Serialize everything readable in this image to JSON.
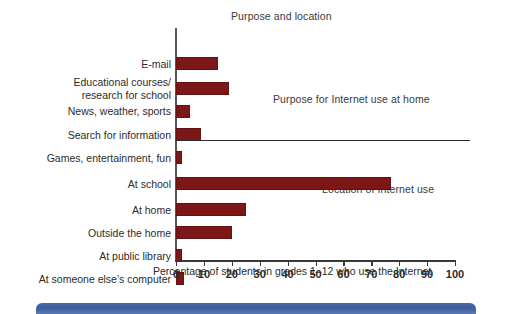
{
  "figure": {
    "title": "Purpose and location",
    "axis_title": "Percentage of students in grades 1–12 who use the Internet",
    "panel_captions": {
      "purpose": "Purpose for Internet use at home",
      "location": "Location of Internet use"
    },
    "bar_color": "#7d1616",
    "axis_color": "#3a3a3a",
    "footer_accent_color": "#3d5c9b"
  },
  "chart_data": {
    "type": "bar",
    "orientation": "horizontal",
    "title": "Purpose and location",
    "xlabel": "Percentage of students in grades 1–12 who use the Internet",
    "ylabel": "",
    "xlim": [
      0,
      100
    ],
    "grid": false,
    "legend": null,
    "xticks": [
      0,
      10,
      20,
      30,
      40,
      50,
      60,
      70,
      80,
      90,
      100
    ],
    "xticklabels": [
      "0",
      "10",
      "20",
      "30",
      "40",
      "50",
      "60",
      "70",
      "80",
      "90",
      "100"
    ],
    "groups": [
      {
        "caption": "Purpose for Internet use at home",
        "categories": [
          "E-mail",
          "Educational courses/\nresearch for school",
          "News, weather, sports",
          "Search for information",
          "Games, entertainment, fun"
        ],
        "values": [
          15,
          19,
          5,
          9,
          2
        ]
      },
      {
        "caption": "Location of Internet use",
        "categories": [
          "At school",
          "At home",
          "Outside the home",
          "At public library",
          "At someone else's computer"
        ],
        "values": [
          77,
          25,
          20,
          2,
          3
        ]
      }
    ],
    "categories": [
      "E-mail",
      "Educational courses/research for school",
      "News, weather, sports",
      "Search for information",
      "Games, entertainment, fun",
      "At school",
      "At home",
      "Outside the home",
      "At public library",
      "At someone else's computer"
    ],
    "values": [
      15,
      19,
      5,
      9,
      2,
      77,
      25,
      20,
      2,
      3
    ]
  },
  "labels": {
    "email": "E-mail",
    "edu_line1": "Educational courses/",
    "edu_line2": "research for school",
    "news": "News, weather, sports",
    "search": "Search for information",
    "games": "Games, entertainment, fun",
    "at_school": "At school",
    "at_home": "At home",
    "outside_home": "Outside the home",
    "public_library": "At public library",
    "someone_else": "At someone else’s computer"
  }
}
